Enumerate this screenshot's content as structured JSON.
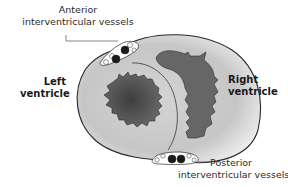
{
  "diagram": {
    "labels": {
      "anterior_line1": "Anterior",
      "anterior_line2": "interventricular vessels",
      "left_line1": "Left",
      "left_line2": "ventricle",
      "right_line1": "Right",
      "right_line2": "ventricle",
      "posterior_line1": "Posterior",
      "posterior_line2": "interventricular vessels"
    },
    "colors": {
      "outline": "#2a2a2a",
      "wall_light": "#ebebeb",
      "wall_mid": "#c8c8c8",
      "cavity_left": "#555555",
      "cavity_right": "#666666",
      "vessel_fill": "#1a1a1a",
      "fat_fill": "#ffffff"
    }
  }
}
